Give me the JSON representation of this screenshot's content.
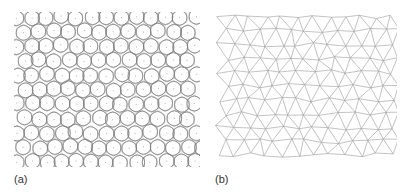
{
  "figure": {
    "panels": [
      {
        "id": "a",
        "label": "(a)",
        "type": "circle-packing",
        "x": 14,
        "y": 12,
        "width": 186,
        "height": 155,
        "rows": 11,
        "cols": 13,
        "circle_radius": 7.4,
        "stroke_color": "#6a6a6a",
        "center_dot_color": "#999999",
        "seed": 7
      },
      {
        "id": "b",
        "label": "(b)",
        "type": "triangulation-mesh",
        "x": 215,
        "y": 12,
        "width": 182,
        "height": 148,
        "rows": 11,
        "cols": 12,
        "stroke_color": "#9a9a9a",
        "seed": 13
      }
    ],
    "label_positions": [
      {
        "id": "a",
        "x": 14,
        "y": 173
      },
      {
        "id": "b",
        "x": 215,
        "y": 173
      }
    ]
  }
}
